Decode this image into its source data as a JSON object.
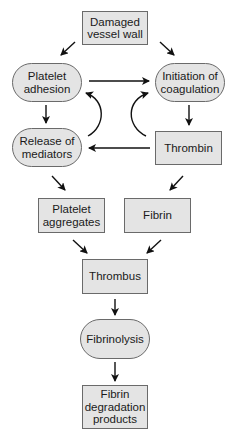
{
  "diagram": {
    "type": "flowchart",
    "colors": {
      "node_fill": "#e4e4e4",
      "node_border": "#6a6a6a",
      "arrow": "#111111",
      "text": "#1a1a1a"
    },
    "nodes": {
      "damaged_vessel_wall": {
        "label": "Damaged\nvessel wall",
        "shape": "rectangle"
      },
      "platelet_adhesion": {
        "label": "Platelet\nadhesion",
        "shape": "rounded"
      },
      "initiation_of_coagulation": {
        "label": "Initiation of\ncoagulation",
        "shape": "rounded"
      },
      "release_of_mediators": {
        "label": "Release of\nmediators",
        "shape": "rounded"
      },
      "thrombin": {
        "label": "Thrombin",
        "shape": "rectangle"
      },
      "platelet_aggregates": {
        "label": "Platelet\naggregates",
        "shape": "rectangle"
      },
      "fibrin": {
        "label": "Fibrin",
        "shape": "rectangle"
      },
      "thrombus": {
        "label": "Thrombus",
        "shape": "rectangle"
      },
      "fibrinolysis": {
        "label": "Fibrinolysis",
        "shape": "rounded"
      },
      "fibrin_degradation_products": {
        "label": "Fibrin\ndegradation\nproducts",
        "shape": "rectangle"
      }
    },
    "edges": [
      {
        "from": "damaged_vessel_wall",
        "to": "platelet_adhesion"
      },
      {
        "from": "damaged_vessel_wall",
        "to": "initiation_of_coagulation"
      },
      {
        "from": "platelet_adhesion",
        "to": "initiation_of_coagulation"
      },
      {
        "from": "platelet_adhesion",
        "to": "release_of_mediators"
      },
      {
        "from": "release_of_mediators",
        "to": "platelet_adhesion",
        "style": "curved"
      },
      {
        "from": "thrombin",
        "to": "initiation_of_coagulation",
        "style": "curved"
      },
      {
        "from": "initiation_of_coagulation",
        "to": "thrombin"
      },
      {
        "from": "thrombin",
        "to": "release_of_mediators"
      },
      {
        "from": "release_of_mediators",
        "to": "platelet_aggregates"
      },
      {
        "from": "thrombin",
        "to": "fibrin"
      },
      {
        "from": "platelet_aggregates",
        "to": "thrombus"
      },
      {
        "from": "fibrin",
        "to": "thrombus"
      },
      {
        "from": "thrombus",
        "to": "fibrinolysis"
      },
      {
        "from": "fibrinolysis",
        "to": "fibrin_degradation_products"
      }
    ]
  }
}
